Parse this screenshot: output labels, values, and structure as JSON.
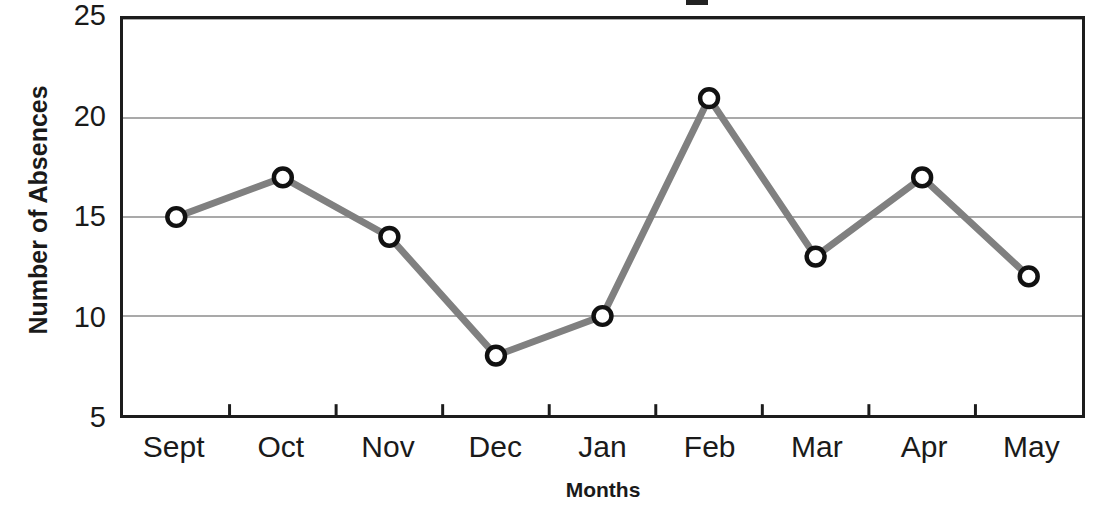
{
  "chart_data": {
    "type": "line",
    "title": "",
    "xlabel": "Months",
    "ylabel": "Number of Absences",
    "categories": [
      "Sept",
      "Oct",
      "Nov",
      "Dec",
      "Jan",
      "Feb",
      "Mar",
      "Apr",
      "May"
    ],
    "values": [
      15,
      17,
      14,
      8,
      10,
      21,
      13,
      17,
      12
    ],
    "series": [
      {
        "name": "Number of Absences",
        "values": [
          15,
          17,
          14,
          8,
          10,
          21,
          13,
          17,
          12
        ]
      }
    ],
    "ylim": [
      5,
      25
    ],
    "yticks": [
      5,
      10,
      15,
      20,
      25
    ],
    "ytick_labels": [
      "5",
      "10",
      "15",
      "20",
      "25"
    ],
    "grid": "horizontal",
    "legend": "none",
    "colors": {
      "line": "#808080",
      "marker_stroke": "#111111",
      "marker_fill": "#ffffff",
      "axis": "#1c1c1c",
      "gridline": "#8c8c8c",
      "background": "#ffffff",
      "text": "#1a1a1a"
    },
    "marker": "circle-open",
    "line_width": 7,
    "marker_radius": 9
  }
}
